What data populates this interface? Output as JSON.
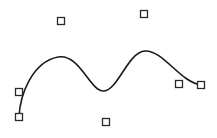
{
  "diagram": {
    "type": "spline-with-control-points",
    "colors": {
      "background": "#ffffff",
      "curve": "#1a1a1a",
      "control_point_stroke": "#2a2a2a",
      "control_point_fill": "#ffffff"
    },
    "control_point_size": 7,
    "control_points": [
      {
        "x": 19,
        "y": 117
      },
      {
        "x": 19,
        "y": 92
      },
      {
        "x": 61,
        "y": 21
      },
      {
        "x": 106,
        "y": 122
      },
      {
        "x": 144,
        "y": 14
      },
      {
        "x": 179,
        "y": 84
      },
      {
        "x": 201,
        "y": 85
      }
    ],
    "curve_path": "M19,117 C20,95 32,62 58,57 C80,53 90,92 104,91 C118,90 128,52 145,51 C163,50 180,82 201,85"
  }
}
